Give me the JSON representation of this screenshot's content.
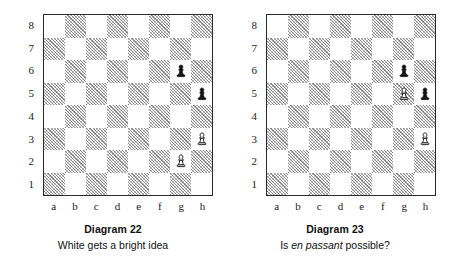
{
  "page": {
    "background": "#ffffff",
    "board_light_color": "#ffffff",
    "board_dark_color": "#9a9a9a",
    "border_color": "#2b2b2b"
  },
  "files": [
    "a",
    "b",
    "c",
    "d",
    "e",
    "f",
    "g",
    "h"
  ],
  "ranks": [
    "8",
    "7",
    "6",
    "5",
    "4",
    "3",
    "2",
    "1"
  ],
  "diagrams": [
    {
      "id": "diagram-22",
      "title": "Diagram 22",
      "caption_prefix": "White gets a bright idea",
      "caption_emphasis": "",
      "caption_suffix": "",
      "pieces": [
        {
          "square": "g6",
          "color": "black",
          "type": "pawn"
        },
        {
          "square": "h5",
          "color": "black",
          "type": "pawn"
        },
        {
          "square": "h3",
          "color": "white",
          "type": "pawn"
        },
        {
          "square": "g2",
          "color": "white",
          "type": "pawn"
        }
      ]
    },
    {
      "id": "diagram-23",
      "title": "Diagram 23",
      "caption_prefix": "Is ",
      "caption_emphasis": "en passant",
      "caption_suffix": " possible?",
      "pieces": [
        {
          "square": "g6",
          "color": "black",
          "type": "pawn"
        },
        {
          "square": "g5",
          "color": "white",
          "type": "pawn"
        },
        {
          "square": "h5",
          "color": "black",
          "type": "pawn"
        },
        {
          "square": "h3",
          "color": "white",
          "type": "pawn"
        }
      ]
    }
  ]
}
